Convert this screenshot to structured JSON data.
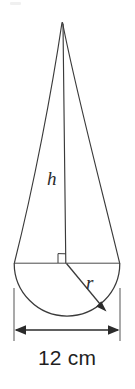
{
  "figure": {
    "ink_color": "#3a3a3a",
    "background_color": "#ffffff",
    "labels": {
      "height": "h",
      "radius": "r",
      "diameter": "12 cm"
    },
    "dimension": {
      "value": "12",
      "unit": "cm",
      "full_text": "12 cm",
      "measures": "diameter of base"
    },
    "markers": {
      "right_angle": "right-angle-square",
      "radius_arrow": "arrowhead-at-arc",
      "dimension_arrows": "double-headed"
    },
    "geometry": {
      "apex_x": 62,
      "apex_y": 22,
      "centre_x": 67,
      "centre_y": 263,
      "base_left_x": 14,
      "base_right_x": 120,
      "radius_px": 53,
      "dim_line_y": 330
    }
  }
}
